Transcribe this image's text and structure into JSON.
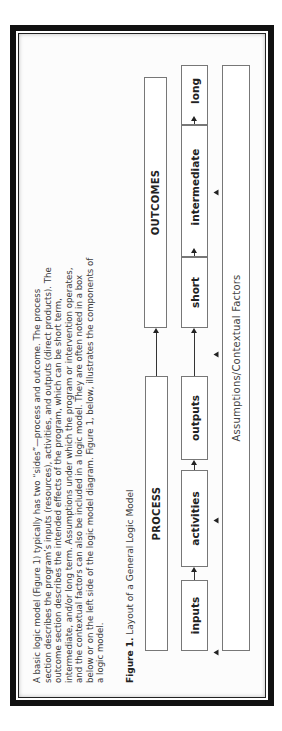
{
  "document": {
    "paragraph_lines": [
      "A basic logic model (Figure 1) typically has two “sides”—process and outcome. The process",
      "section describes the program’s inputs (resources), activities, and outputs (direct products). The",
      "outcome section describes the intended effects of the program, which can be short term,",
      "intermediate, and/or long term. Assumptions under which the program or intervention operates,",
      "and the contextual factors can also be included in a logic model. They are often noted in a box",
      "below or on the left side of the logic model diagram. Figure 1, below, illustrates the components of",
      "a logic model."
    ],
    "figure_caption": {
      "label": "Figure 1.",
      "text": " Layout of a General Logic Model"
    },
    "orientation": "rotated -90deg"
  },
  "diagram": {
    "process_header": "PROCESS",
    "outcomes_header": "OUTCOMES",
    "process_steps": [
      "inputs",
      "activities",
      "outputs"
    ],
    "outcome_steps": [
      "short",
      "intermediate",
      "long"
    ],
    "assumptions": "Assumptions/Contextual Factors"
  },
  "colors": {
    "frame": "#111111",
    "box_border": "#777777",
    "text": "#3a3a3a"
  }
}
